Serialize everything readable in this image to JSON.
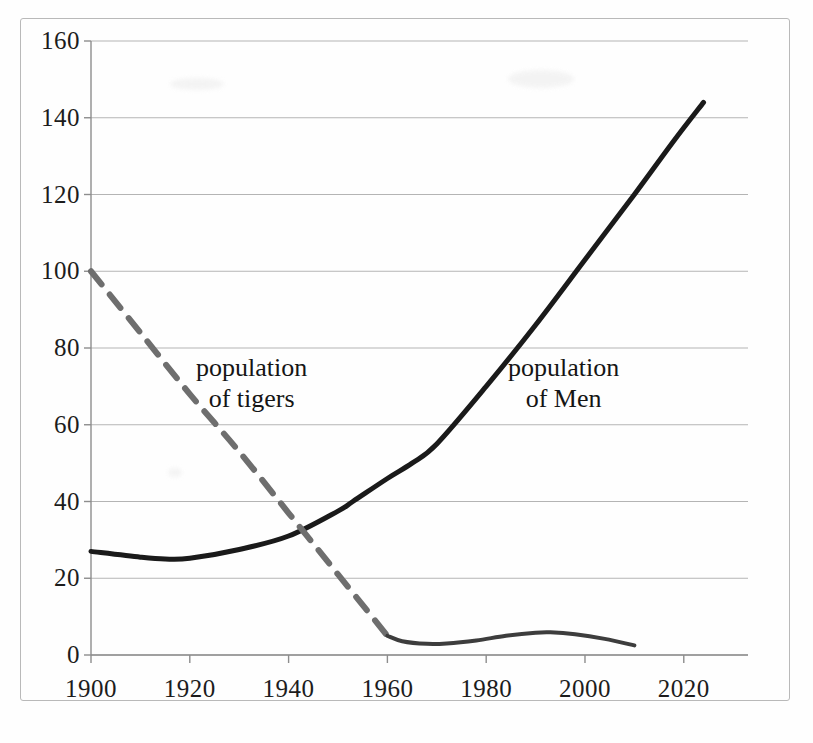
{
  "chart_data": {
    "type": "line",
    "title": "",
    "subtitle": "",
    "xlabel": "",
    "ylabel": "",
    "xlim": [
      1900,
      2033
    ],
    "ylim": [
      0,
      160
    ],
    "grid": true,
    "legend_position": "inline-annotations",
    "x_ticks": [
      1900,
      1920,
      1940,
      1960,
      1980,
      2000,
      2020
    ],
    "x_tick_labels": [
      "1900",
      "1920",
      "1940",
      "1960",
      "1980",
      "2000",
      "2020"
    ],
    "y_ticks": [
      0,
      20,
      40,
      60,
      80,
      100,
      120,
      140,
      160
    ],
    "y_tick_labels": [
      "0",
      "20",
      "40",
      "60",
      "80",
      "100",
      "120",
      "140",
      "160"
    ],
    "series": [
      {
        "name": "population of Men",
        "style": "solid",
        "color": "#1a1a1a",
        "width": 5,
        "x": [
          1900,
          1910,
          1915,
          1920,
          1930,
          1940,
          1950,
          1953,
          1960,
          1965,
          1970,
          1980,
          1990,
          2000,
          2010,
          2018,
          2024
        ],
        "values": [
          27,
          25.5,
          25,
          25.2,
          27.5,
          31,
          37.5,
          40,
          46,
          50,
          55,
          70,
          86,
          103,
          120,
          134,
          144
        ]
      },
      {
        "name": "population of tigers",
        "style": "dashed",
        "color": "#6e6e6e",
        "width": 6,
        "x": [
          1900,
          1910,
          1920,
          1930,
          1940,
          1950,
          1960
        ],
        "values": [
          100,
          84,
          68,
          53,
          37,
          21,
          5
        ]
      },
      {
        "name": "population of tigers (recent)",
        "style": "solid",
        "color": "#3d3d3d",
        "width": 4,
        "x": [
          1960,
          1963,
          1968,
          1972,
          1978,
          1984,
          1990,
          1993,
          1998,
          2004,
          2010
        ],
        "values": [
          5,
          3.6,
          2.9,
          3.0,
          3.8,
          5.0,
          5.8,
          5.9,
          5.4,
          4.2,
          2.5
        ]
      }
    ],
    "annotations": [
      {
        "name": "tigers-label",
        "line1": "population",
        "line2": "of tigers",
        "x": 1940,
        "y": 70
      },
      {
        "name": "men-label",
        "line1": "population",
        "line2": "of Men",
        "x": 2000,
        "y": 70
      }
    ],
    "colors": {
      "axis": "#8d8d8d",
      "grid": "#a8a8a8",
      "men_line": "#1a1a1a",
      "tigers_line": "#6e6e6e",
      "border": "#b9b9b9",
      "background": "#ffffff",
      "text": "#1c1c1c"
    }
  }
}
